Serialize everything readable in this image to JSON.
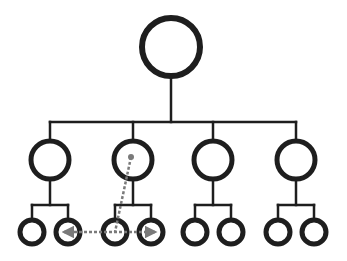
{
  "diagram": {
    "type": "org-chart",
    "colors": {
      "stroke": "#1e1e1e",
      "dotted": "#7a7a7a",
      "background": "#ffffff"
    },
    "root": {
      "id": "root",
      "children": [
        {
          "id": "branch-1",
          "children": [
            {
              "id": "leaf-1a"
            },
            {
              "id": "leaf-1b"
            }
          ]
        },
        {
          "id": "branch-2",
          "children": [
            {
              "id": "leaf-2a"
            },
            {
              "id": "leaf-2b"
            }
          ]
        },
        {
          "id": "branch-3",
          "children": [
            {
              "id": "leaf-3a"
            },
            {
              "id": "leaf-3b"
            }
          ]
        },
        {
          "id": "branch-4",
          "children": [
            {
              "id": "leaf-4a"
            },
            {
              "id": "leaf-4b"
            }
          ]
        }
      ]
    },
    "annotations": [
      {
        "type": "dotted-line",
        "from": "branch-2",
        "to": "leaf-2a"
      },
      {
        "type": "dotted-double-arrow",
        "from": "leaf-1b",
        "to": "leaf-2b"
      }
    ]
  }
}
